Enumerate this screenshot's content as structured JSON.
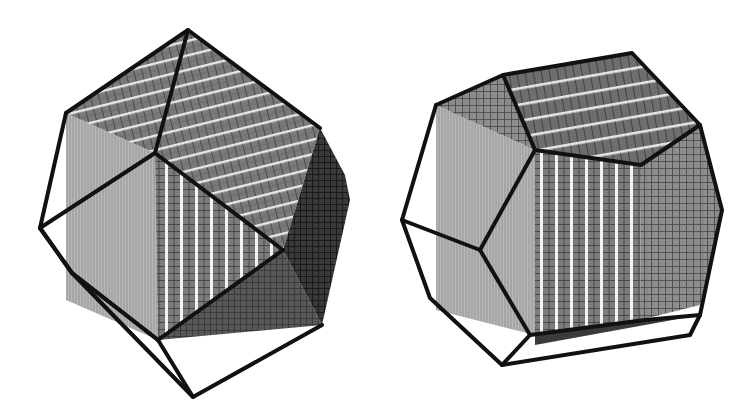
{
  "figure": {
    "background": "#ffffff",
    "line_color": "#111111",
    "panels": [
      {
        "id": "left",
        "subject": "dodecahedral form built from cube decrements (pyritohedron-like)",
        "faces": [
          "top-stepped-face",
          "left-cube-face",
          "front-striped-face",
          "right-dark-face",
          "bottom-stepped-face"
        ]
      },
      {
        "id": "right",
        "subject": "rhombic/pentagonal polyhedron enclosing a cube with stepped top",
        "faces": [
          "top-stepped-face",
          "left-cube-face",
          "front-striped-face",
          "right-face"
        ]
      }
    ]
  }
}
